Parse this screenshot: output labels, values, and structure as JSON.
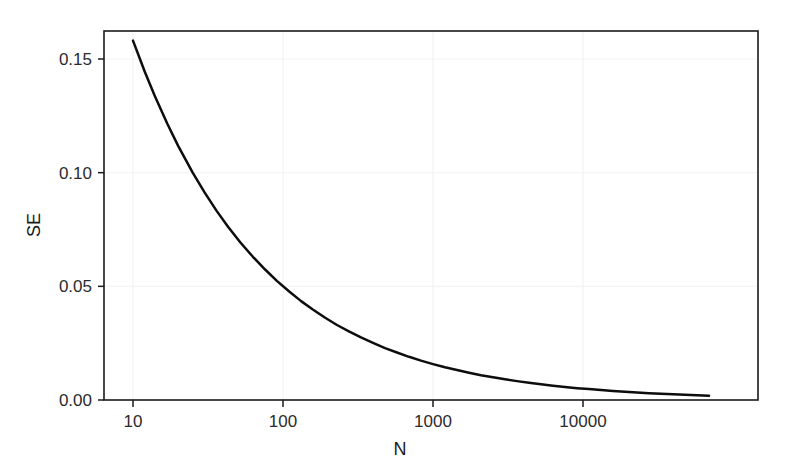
{
  "chart_data": {
    "type": "line",
    "title": "",
    "subtitle": "",
    "xlabel": "N",
    "ylabel": "SE",
    "xscale": "log",
    "yscale": "linear",
    "xlim": [
      8,
      80000
    ],
    "ylim": [
      0.0,
      0.168
    ],
    "grid": true,
    "grid_color": "#f4f4f4",
    "legend": "none",
    "line_color": "#0d0d0d",
    "background_color": "#ffffff",
    "frame_color": "#1b1b1b",
    "formula": "SE = 0.5 / sqrt(N)",
    "x_tick_labels": [
      "10",
      "100",
      "1000",
      "10000"
    ],
    "x_tick_values": [
      10,
      100,
      1000,
      10000
    ],
    "y_tick_labels": [
      "0.00",
      "0.05",
      "0.10",
      "0.15"
    ],
    "y_tick_values": [
      0.0,
      0.05,
      0.1,
      0.15
    ],
    "series": [
      {
        "name": "SE",
        "x": [
          10,
          12,
          14,
          17,
          20,
          25,
          30,
          36,
          43,
          52,
          63,
          76,
          91,
          110,
          132,
          158,
          190,
          229,
          275,
          331,
          398,
          479,
          575,
          692,
          832,
          1000,
          1202,
          1445,
          1738,
          2089,
          2512,
          3020,
          3631,
          4365,
          5248,
          6310,
          7586,
          9120,
          10965,
          13183,
          15849,
          19055,
          22909,
          27542,
          33113,
          39811,
          47863,
          57544,
          69183
        ],
        "y": [
          0.1581,
          0.1443,
          0.1336,
          0.1213,
          0.1118,
          0.1,
          0.0913,
          0.0833,
          0.0762,
          0.0693,
          0.063,
          0.0574,
          0.0524,
          0.0477,
          0.0435,
          0.0398,
          0.0363,
          0.033,
          0.0302,
          0.0275,
          0.0251,
          0.0228,
          0.0209,
          0.019,
          0.0173,
          0.0158,
          0.0144,
          0.0132,
          0.012,
          0.0109,
          0.01,
          0.0091,
          0.0083,
          0.0076,
          0.0069,
          0.0063,
          0.0057,
          0.0052,
          0.0048,
          0.0044,
          0.004,
          0.0036,
          0.0033,
          0.003,
          0.0027,
          0.0025,
          0.0023,
          0.0021,
          0.0019
        ]
      }
    ],
    "annotations": []
  },
  "figure": {
    "name": "standard-error-vs-sample-size-plot"
  }
}
